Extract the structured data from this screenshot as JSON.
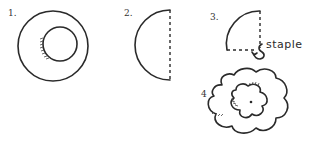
{
  "diagram": {
    "type": "instructional-steps",
    "steps": [
      {
        "number": "1.",
        "shape": "ring",
        "description": "Two concentric circles"
      },
      {
        "number": "2.",
        "shape": "half-circle",
        "description": "Circle folded in half along dashed line"
      },
      {
        "number": "3.",
        "shape": "quarter-circle",
        "description": "Folded again into a quarter",
        "annotation": "staple"
      },
      {
        "number": "4",
        "shape": "wavy-ring",
        "description": "Unfolded wavy flower shape with center dot"
      }
    ]
  },
  "colors": {
    "ink": "#2a2a2a",
    "background": "#ffffff"
  }
}
